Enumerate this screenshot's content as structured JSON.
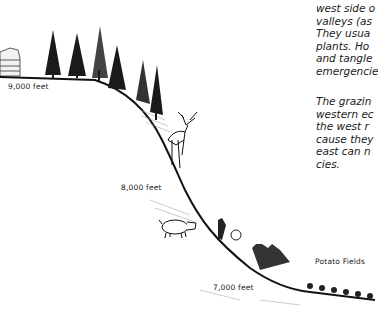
{
  "figure": {
    "elevation_labels": [
      {
        "text": "9,000 feet",
        "x": 8,
        "y": 82
      },
      {
        "text": "8,000 feet",
        "x": 121,
        "y": 183
      },
      {
        "text": "7,000 feet",
        "x": 213,
        "y": 283
      }
    ],
    "zone_label": {
      "text": "Potato Fields",
      "x": 315,
      "y": 257
    },
    "illustrations": [
      "hut",
      "conifer-trees",
      "deer",
      "pig",
      "shrubs",
      "potato-plants",
      "hillside-slope"
    ]
  },
  "text": {
    "paragraph1": [
      "west side o",
      "valleys (as",
      "They  usua",
      "plants.  Ho",
      "and  tangle",
      "emergencie"
    ],
    "paragraph2": [
      "The  grazin",
      "western  ec",
      "the  west  r",
      "cause they",
      "east  can  n",
      "cies."
    ]
  }
}
